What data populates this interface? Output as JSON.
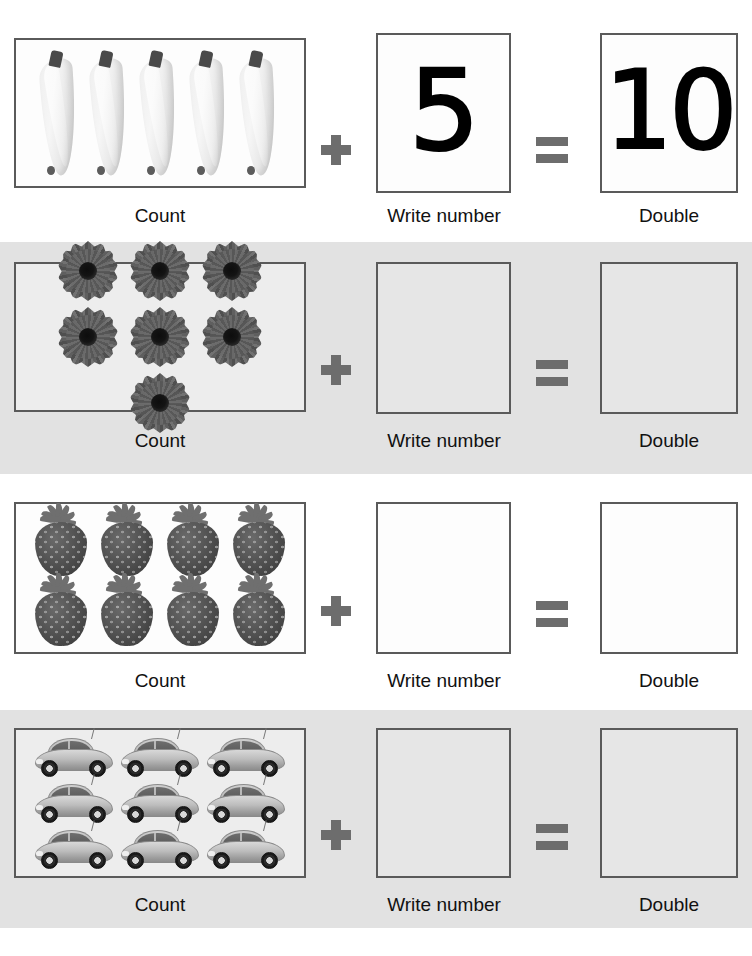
{
  "worksheet": {
    "column_labels": {
      "count": "Count",
      "write_number": "Write number",
      "double": "Double"
    },
    "operators": {
      "plus": "+",
      "equals": "="
    },
    "rows": [
      {
        "id": "row-bananas",
        "item": "banana",
        "item_plural": "bananas",
        "count": 5,
        "written_number": "5",
        "double_value": "10",
        "background": "#ffffff",
        "label_count": "Count",
        "label_write_number": "Write number",
        "label_double": "Double",
        "grid": {
          "columns": 5,
          "rows": 1
        }
      },
      {
        "id": "row-flowers",
        "item": "flower",
        "item_plural": "flowers",
        "count": 7,
        "written_number": "",
        "double_value": "",
        "background": "#e2e2e2",
        "label_count": "Count",
        "label_write_number": "Write number",
        "label_double": "Double",
        "grid": {
          "columns": 4,
          "rows": 2
        }
      },
      {
        "id": "row-strawberries",
        "item": "strawberry",
        "item_plural": "strawberries",
        "count": 8,
        "written_number": "",
        "double_value": "",
        "background": "#ffffff",
        "label_count": "Count",
        "label_write_number": "Write number",
        "label_double": "Double",
        "grid": {
          "columns": 4,
          "rows": 2
        }
      },
      {
        "id": "row-cars",
        "item": "car",
        "item_plural": "cars",
        "count": 9,
        "written_number": "",
        "double_value": "",
        "background": "#e2e2e2",
        "label_count": "Count",
        "label_write_number": "Write number",
        "label_double": "Double",
        "grid": {
          "columns": 3,
          "rows": 3
        }
      }
    ],
    "colors": {
      "row_white": "#ffffff",
      "row_gray": "#e2e2e2",
      "box_border": "#5a5a5a",
      "operator": "#6d6d6d",
      "label_text": "#111111",
      "numeral": "#000000",
      "top_band": "#cfcfcf"
    }
  }
}
